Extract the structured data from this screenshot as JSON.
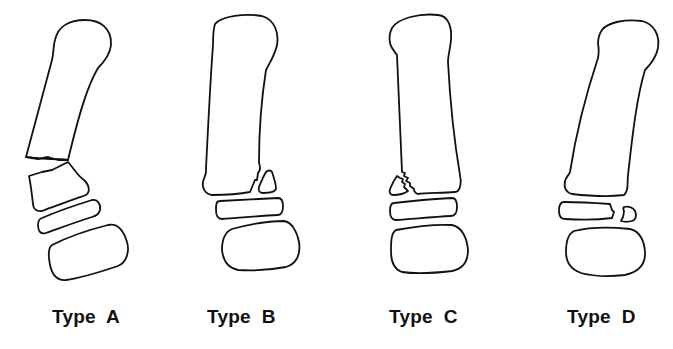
{
  "figure": {
    "types": [
      {
        "id": "A",
        "label": "Type  A",
        "label_x": 52
      },
      {
        "id": "B",
        "label": "Type  B",
        "label_x": 207
      },
      {
        "id": "C",
        "label": "Type  C",
        "label_x": 389
      },
      {
        "id": "D",
        "label": "Type  D",
        "label_x": 567
      }
    ],
    "stroke_color": "#111111",
    "background_color": "#ffffff"
  }
}
